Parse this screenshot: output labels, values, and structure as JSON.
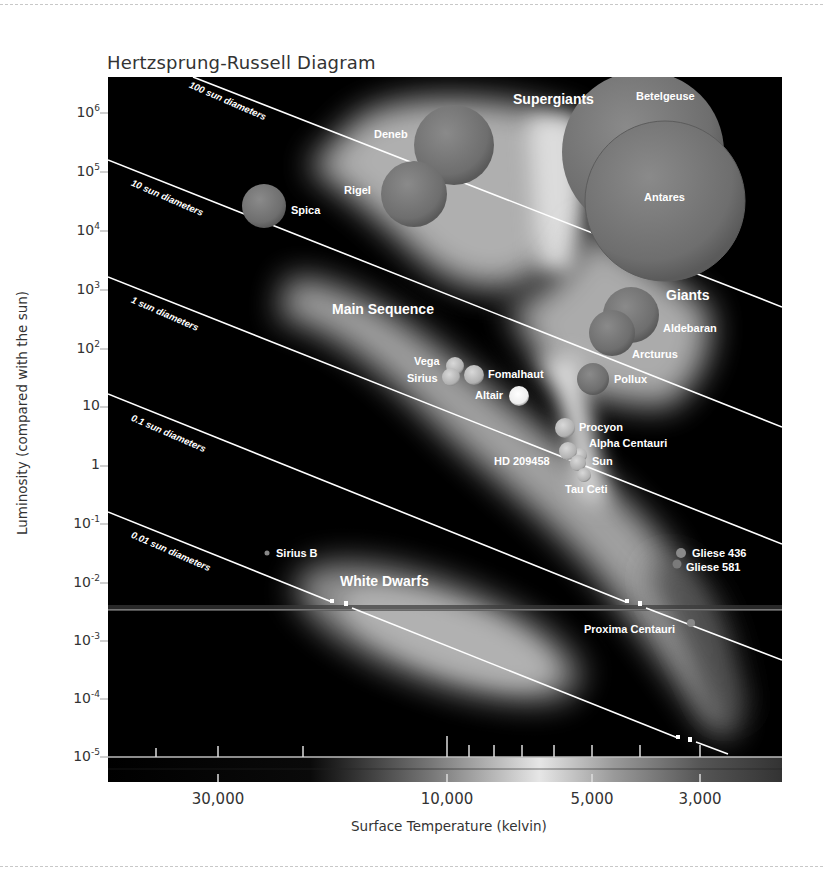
{
  "header": {
    "title": "Hertzsprung-Russell Diagram"
  },
  "axes": {
    "ylabel": "Luminosity (compared with the sun)",
    "xlabel": "Surface Temperature (kelvin)",
    "y_ticks": [
      {
        "base": "10",
        "exp": "6",
        "y": 113
      },
      {
        "base": "10",
        "exp": "5",
        "y": 172
      },
      {
        "base": "10",
        "exp": "4",
        "y": 231
      },
      {
        "base": "10",
        "exp": "3",
        "y": 290
      },
      {
        "base": "10",
        "exp": "2",
        "y": 349
      },
      {
        "base": "10",
        "exp": "",
        "y": 407
      },
      {
        "base": "1",
        "exp": "",
        "y": 466
      },
      {
        "base": "10",
        "exp": "-1",
        "y": 524
      },
      {
        "base": "10",
        "exp": "-2",
        "y": 583
      },
      {
        "base": "10",
        "exp": "-3",
        "y": 641
      },
      {
        "base": "10",
        "exp": "-4",
        "y": 699
      },
      {
        "base": "10",
        "exp": "-5",
        "y": 757
      }
    ],
    "x_ticks": [
      {
        "label": "30,000",
        "x": 218
      },
      {
        "label": "10,000",
        "x": 447
      },
      {
        "label": "5,000",
        "x": 592
      },
      {
        "label": "3,000",
        "x": 700
      }
    ]
  },
  "regions": {
    "supergiants": "Supergiants",
    "giants": "Giants",
    "main_sequence": "Main Sequence",
    "white_dwarfs": "White Dwarfs"
  },
  "diameter_lines": {
    "d100": "100 sun diameters",
    "d10": "10 sun diameters",
    "d1": "1 sun diameters",
    "d01": "0.1 sun diameters",
    "d001": "0.01 sun diameters"
  },
  "stars": {
    "betelgeuse": "Betelgeuse",
    "antares": "Antares",
    "deneb": "Deneb",
    "rigel": "Rigel",
    "spica": "Spica",
    "aldebaran": "Aldebaran",
    "arcturus": "Arcturus",
    "pollux": "Pollux",
    "vega": "Vega",
    "sirius": "Sirius",
    "fomalhaut": "Fomalhaut",
    "altair": "Altair",
    "procyon": "Procyon",
    "alpha_centauri": "Alpha Centauri",
    "hd209458": "HD 209458",
    "sun": "Sun",
    "tau_ceti": "Tau Ceti",
    "sirius_b": "Sirius B",
    "gliese436": "Gliese 436",
    "gliese581": "Gliese 581",
    "proxima": "Proxima Centauri"
  },
  "chart_data": {
    "type": "scatter",
    "title": "Hertzsprung-Russell Diagram",
    "xlabel": "Surface Temperature (kelvin)",
    "ylabel": "Luminosity (compared with the sun)",
    "x_scale": "log, reversed",
    "y_scale": "log",
    "x_ticks": [
      30000,
      10000,
      5000,
      3000
    ],
    "y_ticks": [
      1000000.0,
      100000.0,
      10000.0,
      1000.0,
      100,
      10,
      1,
      0.1,
      0.01,
      0.001,
      0.0001,
      1e-05
    ],
    "ylim": [
      1e-05,
      3000000
    ],
    "xlim": [
      60000,
      2200
    ],
    "regions": [
      "Supergiants",
      "Giants",
      "Main Sequence",
      "White Dwarfs"
    ],
    "constant_radius_lines": [
      "100 sun diameters",
      "10 sun diameters",
      "1 sun diameters",
      "0.1 sun diameters",
      "0.01 sun diameters"
    ],
    "points": [
      {
        "name": "Betelgeuse",
        "temp_k": 3500,
        "luminosity": 200000
      },
      {
        "name": "Antares",
        "temp_k": 3500,
        "luminosity": 60000
      },
      {
        "name": "Deneb",
        "temp_k": 9500,
        "luminosity": 250000
      },
      {
        "name": "Rigel",
        "temp_k": 12000,
        "luminosity": 50000
      },
      {
        "name": "Spica",
        "temp_k": 23000,
        "luminosity": 25000
      },
      {
        "name": "Aldebaran",
        "temp_k": 4000,
        "luminosity": 400
      },
      {
        "name": "Arcturus",
        "temp_k": 4300,
        "luminosity": 170
      },
      {
        "name": "Pollux",
        "temp_k": 4700,
        "luminosity": 30
      },
      {
        "name": "Vega",
        "temp_k": 9500,
        "luminosity": 50
      },
      {
        "name": "Sirius",
        "temp_k": 9800,
        "luminosity": 30
      },
      {
        "name": "Fomalhaut",
        "temp_k": 8600,
        "luminosity": 35
      },
      {
        "name": "Altair",
        "temp_k": 7000,
        "luminosity": 15
      },
      {
        "name": "Procyon",
        "temp_k": 5800,
        "luminosity": 4.5
      },
      {
        "name": "Alpha Centauri",
        "temp_k": 5500,
        "luminosity": 1.5
      },
      {
        "name": "HD 209458",
        "temp_k": 5700,
        "luminosity": 1.6
      },
      {
        "name": "Sun",
        "temp_k": 5500,
        "luminosity": 1
      },
      {
        "name": "Tau Ceti",
        "temp_k": 5300,
        "luminosity": 0.6
      },
      {
        "name": "Sirius B",
        "temp_k": 22000,
        "luminosity": 0.03
      },
      {
        "name": "Gliese 436",
        "temp_k": 3300,
        "luminosity": 0.03
      },
      {
        "name": "Gliese 581",
        "temp_k": 3350,
        "luminosity": 0.02
      },
      {
        "name": "Proxima Centauri",
        "temp_k": 3050,
        "luminosity": 0.002
      }
    ],
    "grid": false,
    "legend": "none"
  }
}
